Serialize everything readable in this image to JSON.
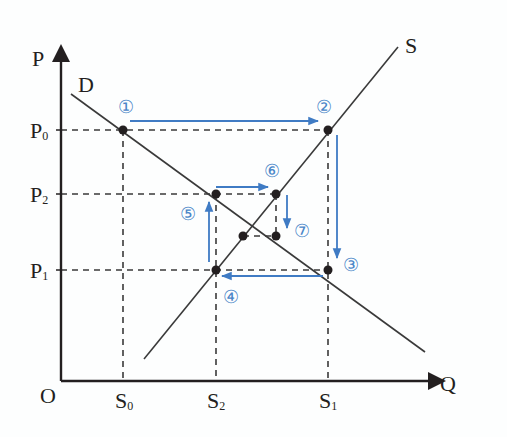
{
  "diagram": {
    "axes": {
      "y_label": "P",
      "x_label": "Q",
      "origin_label": "O"
    },
    "curves": {
      "demand_label": "D",
      "supply_label": "S"
    },
    "price_ticks": [
      {
        "label": "P",
        "sub": "0"
      },
      {
        "label": "P",
        "sub": "2"
      },
      {
        "label": "P",
        "sub": "1"
      }
    ],
    "quantity_ticks": [
      {
        "label": "S",
        "sub": "0"
      },
      {
        "label": "S",
        "sub": "2"
      },
      {
        "label": "S",
        "sub": "1"
      }
    ],
    "steps": [
      "①",
      "②",
      "③",
      "④",
      "⑤",
      "⑥",
      "⑦"
    ],
    "colors": {
      "axis": "#231f20",
      "curve": "#3a3a3a",
      "dashed": "#3a3a3a",
      "arrow": "#3f7bc4",
      "step_label": "#4a86c8"
    }
  }
}
